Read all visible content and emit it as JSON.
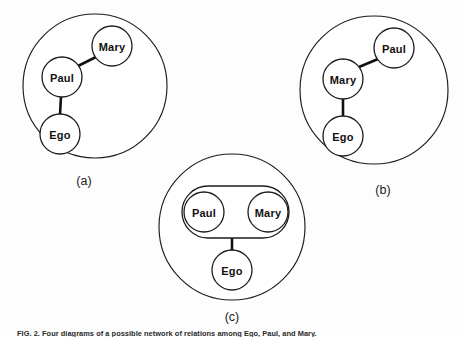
{
  "figure": {
    "caption": "FIG. 2. Four diagrams of a possible network of relations among Ego, Paul, and Mary.",
    "background_color": "#fdfdfd",
    "stroke_color": "#1c1c1c",
    "line_color": "#111111",
    "panels": [
      {
        "id": "a",
        "label": "(a)",
        "boundary": {
          "cx": 95,
          "cy": 86,
          "r": 72
        },
        "label_pos": {
          "x": 84,
          "y": 181
        },
        "nodes": [
          {
            "name": "Mary",
            "cx": 112,
            "cy": 46,
            "r": 20
          },
          {
            "name": "Paul",
            "cx": 62,
            "cy": 77,
            "r": 20
          },
          {
            "name": "Ego",
            "cx": 60,
            "cy": 134,
            "r": 20
          }
        ],
        "edges": [
          {
            "from": "Paul",
            "to": "Mary"
          },
          {
            "from": "Paul",
            "to": "Ego"
          }
        ]
      },
      {
        "id": "b",
        "label": "(b)",
        "boundary": {
          "cx": 374,
          "cy": 90,
          "r": 74
        },
        "label_pos": {
          "x": 383,
          "y": 190
        },
        "nodes": [
          {
            "name": "Paul",
            "cx": 394,
            "cy": 48,
            "r": 20
          },
          {
            "name": "Mary",
            "cx": 343,
            "cy": 79,
            "r": 20
          },
          {
            "name": "Ego",
            "cx": 343,
            "cy": 136,
            "r": 20
          }
        ],
        "edges": [
          {
            "from": "Mary",
            "to": "Paul"
          },
          {
            "from": "Mary",
            "to": "Ego"
          }
        ]
      },
      {
        "id": "c",
        "label": "(c)",
        "boundary": {
          "cx": 232,
          "cy": 227,
          "r": 73
        },
        "label_pos": {
          "x": 232,
          "y": 317
        },
        "group": {
          "x": 182,
          "y": 186,
          "width": 107,
          "height": 52,
          "rx": 26
        },
        "nodes": [
          {
            "name": "Paul",
            "cx": 204,
            "cy": 212,
            "r": 20
          },
          {
            "name": "Mary",
            "cx": 268,
            "cy": 212,
            "r": 20
          },
          {
            "name": "Ego",
            "cx": 232,
            "cy": 270,
            "r": 20
          }
        ],
        "edges": [
          {
            "from": "group",
            "to": "Ego"
          }
        ]
      }
    ]
  }
}
